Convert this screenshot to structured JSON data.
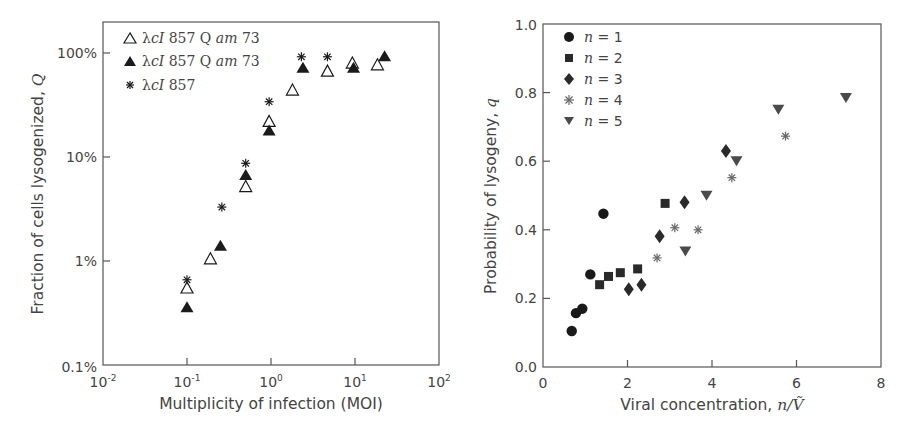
{
  "chart_data": [
    {
      "type": "scatter",
      "title": "",
      "xlabel": "Multiplicity of infection (MOI)",
      "ylabel": "Fraction of cells lysogenized, Q",
      "xscale": "log",
      "yscale": "log",
      "xlim": [
        0.01,
        100
      ],
      "ylim": [
        0.001,
        1.0
      ],
      "x_ticks": [
        "10^-2",
        "10^-1",
        "10^0",
        "10^1",
        "10^2"
      ],
      "y_ticks": [
        "0.1%",
        "1%",
        "10%",
        "100%"
      ],
      "grid": false,
      "legend_position": "upper left",
      "series": [
        {
          "name": "λcI 857 Q am 73 (open triangles)",
          "marker": "open-triangle",
          "x": [
            0.1,
            0.19,
            0.5,
            0.95,
            1.8,
            4.7,
            9.3,
            18.5
          ],
          "y": [
            0.0055,
            0.0105,
            0.052,
            0.22,
            0.44,
            0.67,
            0.8,
            0.77
          ]
        },
        {
          "name": "λcI 857 Q am 73 (filled triangles)",
          "marker": "filled-triangle",
          "x": [
            0.1,
            0.25,
            0.5,
            0.95,
            2.4,
            9.6,
            22.5
          ],
          "y": [
            0.0036,
            0.014,
            0.067,
            0.18,
            0.72,
            0.72,
            0.93
          ]
        },
        {
          "name": "λcI 857",
          "marker": "asterisk",
          "x": [
            0.1,
            0.26,
            0.5,
            0.95,
            2.3,
            4.7
          ],
          "y": [
            0.0066,
            0.033,
            0.087,
            0.34,
            0.92,
            0.92
          ]
        }
      ]
    },
    {
      "type": "scatter",
      "title": "",
      "xlabel": "Viral concentration, n/Ṽ",
      "ylabel": "Probability of lysogeny, q",
      "xlim": [
        0,
        8
      ],
      "ylim": [
        0.0,
        1.0
      ],
      "x_ticks": [
        "0",
        "2",
        "4",
        "6",
        "8"
      ],
      "y_ticks": [
        "0.0",
        "0.2",
        "0.4",
        "0.6",
        "0.8",
        "1.0"
      ],
      "grid": false,
      "legend_position": "upper left",
      "series": [
        {
          "name": "n = 1",
          "marker": "circle",
          "x": [
            0.68,
            0.78,
            0.93,
            1.12,
            1.43
          ],
          "y": [
            0.105,
            0.157,
            0.17,
            0.27,
            0.447
          ]
        },
        {
          "name": "n = 2",
          "marker": "square",
          "x": [
            1.34,
            1.55,
            1.83,
            2.24,
            2.89
          ],
          "y": [
            0.24,
            0.264,
            0.275,
            0.286,
            0.477
          ]
        },
        {
          "name": "n = 3",
          "marker": "diamond",
          "x": [
            2.03,
            2.33,
            2.76,
            3.35,
            4.33
          ],
          "y": [
            0.227,
            0.24,
            0.381,
            0.48,
            0.63
          ]
        },
        {
          "name": "n = 4",
          "marker": "asterisk",
          "x": [
            2.7,
            3.12,
            3.67,
            4.47,
            5.74
          ],
          "y": [
            0.318,
            0.406,
            0.4,
            0.552,
            0.673
          ]
        },
        {
          "name": "n = 5",
          "marker": "down-triangle",
          "x": [
            3.37,
            3.87,
            4.58,
            5.57,
            7.17
          ],
          "y": [
            0.337,
            0.499,
            0.6,
            0.75,
            0.784
          ]
        }
      ]
    }
  ],
  "left": {
    "xlabel": "Multiplicity of infection (MOI)",
    "ylabel_main": "Fraction of cells lysogenized, ",
    "ylabel_var": "Q",
    "yticks": [
      "100%",
      "10%",
      "1%",
      "0.1%"
    ],
    "xticks_base": [
      "10",
      "10",
      "10",
      "10",
      "10"
    ],
    "xticks_exp": [
      "-2",
      "-1",
      "0",
      "1",
      "2"
    ],
    "legend": [
      {
        "prefix": "λ",
        "italic": "cI",
        "rest": " 857 Q ",
        "italic2": "am",
        "rest2": " 73"
      },
      {
        "prefix": "λ",
        "italic": "cI",
        "rest": " 857 Q ",
        "italic2": "am",
        "rest2": " 73"
      },
      {
        "prefix": "λ",
        "italic": "cI",
        "rest": " 857",
        "italic2": "",
        "rest2": ""
      }
    ]
  },
  "right": {
    "xlabel_main": "Viral concentration, ",
    "xlabel_var": "n/Ṽ",
    "ylabel_main": "Probability of lysogeny, ",
    "ylabel_var": "q",
    "yticks": [
      "1.0",
      "0.8",
      "0.6",
      "0.4",
      "0.2",
      "0.0"
    ],
    "xticks": [
      "0",
      "2",
      "4",
      "6",
      "8"
    ],
    "legend": [
      {
        "var": "n",
        "eq": " = 1"
      },
      {
        "var": "n",
        "eq": " = 2"
      },
      {
        "var": "n",
        "eq": " = 3"
      },
      {
        "var": "n",
        "eq": " = 4"
      },
      {
        "var": "n",
        "eq": " = 5"
      }
    ]
  },
  "colors": {
    "axis": "#555555",
    "marker_dark": "#1a1a1a",
    "marker_gray": "#4a4a4a",
    "marker_asterisk_light": "#666666",
    "text": "#444444"
  }
}
